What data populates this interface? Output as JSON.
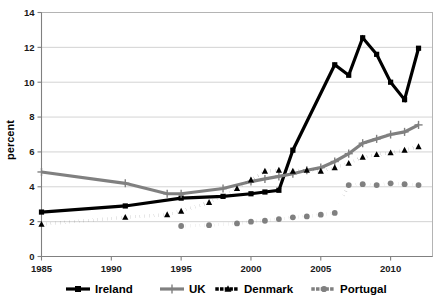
{
  "chart_data": {
    "type": "line",
    "title": "",
    "xlabel": "",
    "ylabel": "percent",
    "xlim": [
      1985,
      2013
    ],
    "ylim": [
      0,
      14
    ],
    "grid": true,
    "legend_position": "bottom",
    "x_ticks": [
      "1985",
      "1990",
      "1995",
      "2000",
      "2005",
      "2010"
    ],
    "x_tick_values": [
      1985,
      1990,
      1995,
      2000,
      2005,
      2010
    ],
    "y_ticks": [
      "0",
      "2",
      "4",
      "6",
      "8",
      "10",
      "12",
      "14"
    ],
    "y_tick_values": [
      0,
      2,
      4,
      6,
      8,
      10,
      12,
      14
    ],
    "series": [
      {
        "name": "Ireland",
        "color": "#000000",
        "style": "solid",
        "marker": "square",
        "x": [
          1985,
          1991,
          1995,
          1998,
          2000,
          2001,
          2002,
          2003,
          2006,
          2007,
          2008,
          2009,
          2010,
          2011,
          2012
        ],
        "values": [
          2.55,
          2.9,
          3.35,
          3.45,
          3.6,
          3.7,
          3.8,
          6.1,
          11.0,
          10.4,
          12.55,
          11.6,
          10.0,
          9.0,
          11.95
        ]
      },
      {
        "name": "UK",
        "color": "#808080",
        "style": "solid",
        "marker": "plus",
        "x": [
          1985,
          1991,
          1994,
          1995,
          1998,
          2000,
          2001,
          2002,
          2003,
          2004,
          2005,
          2006,
          2007,
          2008,
          2009,
          2010,
          2011,
          2012
        ],
        "values": [
          4.85,
          4.2,
          3.6,
          3.6,
          3.9,
          4.3,
          4.45,
          4.6,
          4.75,
          4.95,
          5.1,
          5.45,
          5.9,
          6.5,
          6.75,
          7.0,
          7.15,
          7.55
        ]
      },
      {
        "name": "Denmark",
        "color": "#000000",
        "style": "dotted",
        "marker": "triangle",
        "x": [
          1985,
          1991,
          1994,
          1995,
          1997,
          1999,
          2000,
          2001,
          2002,
          2003,
          2004,
          2005,
          2006,
          2007,
          2008,
          2009,
          2010,
          2011,
          2012
        ],
        "values": [
          1.85,
          2.25,
          2.4,
          2.6,
          3.1,
          3.9,
          4.4,
          4.9,
          4.95,
          4.9,
          4.95,
          4.9,
          5.1,
          5.35,
          5.7,
          5.85,
          5.95,
          6.1,
          6.3
        ]
      },
      {
        "name": "Portugal",
        "color": "#808080",
        "style": "dotted",
        "marker": "circle",
        "x": [
          1995,
          1997,
          1999,
          2000,
          2001,
          2002,
          2003,
          2004,
          2005,
          2006,
          2007,
          2008,
          2009,
          2010,
          2011,
          2012
        ],
        "values": [
          1.75,
          1.8,
          1.9,
          2.0,
          2.05,
          2.15,
          2.25,
          2.3,
          2.4,
          2.5,
          4.1,
          4.15,
          4.1,
          4.2,
          4.15,
          4.1
        ]
      }
    ]
  },
  "legend": {
    "items": [
      {
        "label": "Ireland"
      },
      {
        "label": "UK"
      },
      {
        "label": "Denmark"
      },
      {
        "label": "Portugal"
      }
    ]
  },
  "axes": {
    "y_title": "percent"
  }
}
